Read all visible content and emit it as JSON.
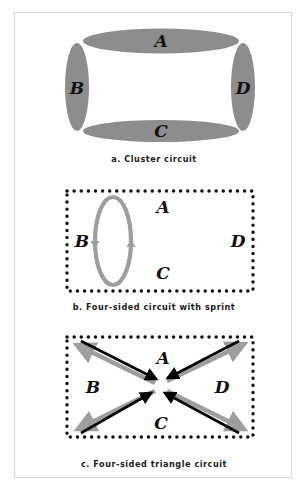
{
  "figure": {
    "title_text": "",
    "background_color": "#ffffff",
    "frame_border_color": "#d8d8d8",
    "node_labels": [
      "A",
      "B",
      "C",
      "D"
    ],
    "shape_fill_gray": "#8d8d8d",
    "arrow_black": "#000000",
    "arrow_gray": "#9e9e9e",
    "dot_color": "#111111"
  },
  "panels": [
    {
      "id": "a",
      "caption": "a. Cluster circuit",
      "diagram_type": "cluster-ellipses",
      "labels": {
        "top": "A",
        "left": "B",
        "bottom": "C",
        "right": "D"
      },
      "elements": [
        {
          "name": "ellipse-a-top",
          "label": "A",
          "orientation": "horizontal",
          "fill": "#8d8d8d"
        },
        {
          "name": "ellipse-b-left",
          "label": "B",
          "orientation": "vertical",
          "fill": "#8d8d8d"
        },
        {
          "name": "ellipse-c-bottom",
          "label": "C",
          "orientation": "horizontal",
          "fill": "#8d8d8d"
        },
        {
          "name": "ellipse-d-right",
          "label": "D",
          "orientation": "vertical",
          "fill": "#8d8d8d"
        }
      ]
    },
    {
      "id": "b",
      "caption": "b. Four-sided circuit with sprint",
      "diagram_type": "dotted-rectangle-with-sprint-loop",
      "labels": {
        "top": "A",
        "left": "B",
        "bottom": "C",
        "right": "D"
      },
      "elements": [
        {
          "name": "dotted-rectangle",
          "dot_color": "#111111"
        },
        {
          "name": "sprint-loop",
          "shape": "vertical-ellipse-outline",
          "stroke": "#9e9e9e",
          "arrowheads": [
            "left-side-down",
            "right-side-up"
          ]
        }
      ]
    },
    {
      "id": "c",
      "caption": "c. Four-sided triangle circuit",
      "diagram_type": "dotted-rectangle-with-diagonal-arrows",
      "labels": {
        "top": "A",
        "left": "B",
        "bottom": "C",
        "right": "D"
      },
      "elements": [
        {
          "name": "dotted-rectangle",
          "dot_color": "#111111"
        },
        {
          "name": "arrow-black-topleft-to-center",
          "color": "#000000",
          "direction": "inward"
        },
        {
          "name": "arrow-black-topright-to-center",
          "color": "#000000",
          "direction": "inward"
        },
        {
          "name": "arrow-black-bottomleft-to-center",
          "color": "#000000",
          "direction": "inward"
        },
        {
          "name": "arrow-black-bottomright-to-center",
          "color": "#000000",
          "direction": "inward"
        },
        {
          "name": "arrow-gray-center-to-topleft",
          "color": "#9e9e9e",
          "direction": "outward"
        },
        {
          "name": "arrow-gray-center-to-topright",
          "color": "#9e9e9e",
          "direction": "outward"
        },
        {
          "name": "arrow-gray-center-to-bottomleft",
          "color": "#9e9e9e",
          "direction": "outward"
        },
        {
          "name": "arrow-gray-center-to-bottomright",
          "color": "#9e9e9e",
          "direction": "outward"
        }
      ]
    }
  ]
}
